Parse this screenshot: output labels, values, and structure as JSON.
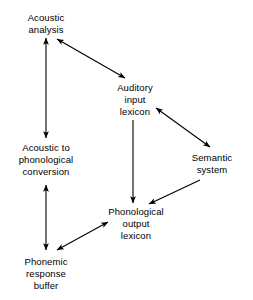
{
  "diagram": {
    "background_color": "#ffffff",
    "line_color": "#000000",
    "text_color": "#000000",
    "nodes": [
      {
        "id": "acoustic-analysis",
        "lines": [
          "Acoustic",
          "analysis"
        ],
        "x": 46,
        "y": 12
      },
      {
        "id": "auditory-input-lexicon",
        "lines": [
          "Auditory",
          "input",
          "lexicon"
        ],
        "x": 135,
        "y": 82
      },
      {
        "id": "acoustic-to-phonological-conversion",
        "lines": [
          "Acoustic to",
          "phonological",
          "conversion"
        ],
        "x": 46,
        "y": 142
      },
      {
        "id": "semantic-system",
        "lines": [
          "Semantic",
          "system"
        ],
        "x": 212,
        "y": 152
      },
      {
        "id": "phonological-output-lexicon",
        "lines": [
          "Phonological",
          "output",
          "lexicon"
        ],
        "x": 136,
        "y": 206
      },
      {
        "id": "phonemic-response-buffer",
        "lines": [
          "Phonemic",
          "response",
          "buffer"
        ],
        "x": 46,
        "y": 256
      }
    ],
    "edges": [
      {
        "id": "acoustic-analysis--acoustic-to-phonological-conversion",
        "from": "acoustic-analysis",
        "to": "acoustic-to-phonological-conversion",
        "x1": 46,
        "y1": 38,
        "x2": 46,
        "y2": 138,
        "heads": "both"
      },
      {
        "id": "acoustic-analysis--auditory-input-lexicon",
        "from": "acoustic-analysis",
        "to": "auditory-input-lexicon",
        "x1": 57,
        "y1": 39,
        "x2": 125,
        "y2": 78,
        "heads": "both"
      },
      {
        "id": "auditory-input-lexicon--semantic-system",
        "from": "auditory-input-lexicon",
        "to": "semantic-system",
        "x1": 156,
        "y1": 108,
        "x2": 210,
        "y2": 147,
        "heads": "both"
      },
      {
        "id": "auditory-input-lexicon--phonological-output-lexicon",
        "from": "auditory-input-lexicon",
        "to": "phonological-output-lexicon",
        "x1": 133,
        "y1": 120,
        "x2": 133,
        "y2": 203,
        "heads": "end"
      },
      {
        "id": "semantic-system--phonological-output-lexicon",
        "from": "semantic-system",
        "to": "phonological-output-lexicon",
        "x1": 200,
        "y1": 180,
        "x2": 149,
        "y2": 204,
        "heads": "end"
      },
      {
        "id": "acoustic-to-phonological-conversion--phonemic-response-buffer",
        "from": "acoustic-to-phonological-conversion",
        "to": "phonemic-response-buffer",
        "x1": 46,
        "y1": 185,
        "x2": 46,
        "y2": 250,
        "heads": "both"
      },
      {
        "id": "phonemic-response-buffer--phonological-output-lexicon",
        "from": "phonemic-response-buffer",
        "to": "phonological-output-lexicon",
        "x1": 57,
        "y1": 250,
        "x2": 108,
        "y2": 222,
        "heads": "both"
      }
    ]
  }
}
